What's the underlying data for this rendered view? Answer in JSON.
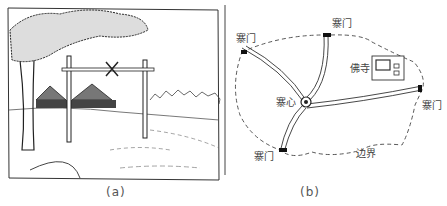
{
  "figure": {
    "panel_a": {
      "caption": "(a)",
      "description": "Sketch of a village gate: two posts with a crossbar and an X symbol, thatched houses behind, large tree at left"
    },
    "panel_b": {
      "caption": "(b)",
      "labels": {
        "gate_nw": "寨门",
        "gate_n": "寨门",
        "gate_e": "寨门",
        "gate_sw": "寨门",
        "center": "寨心",
        "temple": "佛寺",
        "boundary": "边界"
      }
    }
  },
  "colors": {
    "ink": "#222222",
    "label": "#444444",
    "background": "#ffffff"
  }
}
